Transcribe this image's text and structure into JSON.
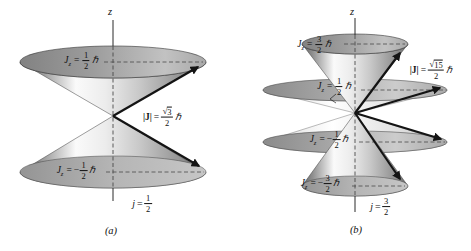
{
  "figure": {
    "background": "#ffffff",
    "arrow_color": "#141414",
    "cone_highlight": "#fafafa",
    "cone_shadow": "#6a6a6a",
    "disk_gray": "#9a9a9a"
  },
  "panel_a": {
    "axis_label": "z",
    "caption": "(a)",
    "cone_labels": [
      {
        "sym": "J",
        "sub": "z",
        "eq": "=",
        "sign": "",
        "num": "1",
        "den": "2",
        "hbar": "ℏ"
      },
      {
        "sym": "J",
        "sub": "z",
        "eq": "=",
        "sign": "−",
        "num": "1",
        "den": "2",
        "hbar": "ℏ"
      }
    ],
    "magnitude": {
      "sym": "|J|",
      "eq": "=",
      "sqrt": "√",
      "radicand": "3",
      "den": "2",
      "hbar": "ℏ"
    },
    "j_label": {
      "sym": "j",
      "eq": "=",
      "num": "1",
      "den": "2"
    }
  },
  "panel_b": {
    "axis_label": "z",
    "caption": "(b)",
    "cone_labels": [
      {
        "sym": "J",
        "sub": "z",
        "eq": "=",
        "sign": "",
        "num": "3",
        "den": "2",
        "hbar": "ℏ"
      },
      {
        "sym": "J",
        "sub": "z",
        "eq": "=",
        "sign": "",
        "num": "1",
        "den": "2",
        "hbar": "ℏ"
      },
      {
        "sym": "J",
        "sub": "z",
        "eq": "=",
        "sign": "−",
        "num": "1",
        "den": "2",
        "hbar": "ℏ"
      },
      {
        "sym": "J",
        "sub": "z",
        "eq": "=",
        "sign": "−",
        "num": "3",
        "den": "2",
        "hbar": "ℏ"
      }
    ],
    "magnitude": {
      "sym": "|J|",
      "eq": "=",
      "sqrt": "√",
      "radicand": "15",
      "den": "2",
      "hbar": "ℏ"
    },
    "j_label": {
      "sym": "j",
      "eq": "=",
      "num": "3",
      "den": "2"
    }
  }
}
